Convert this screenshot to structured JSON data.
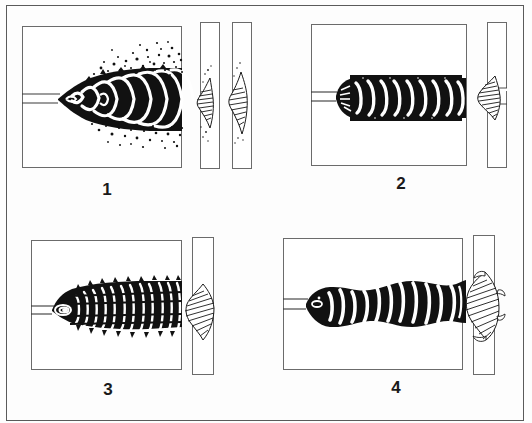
{
  "figure": {
    "background_color": "#ffffff",
    "ink_color": "#000000",
    "frame_color": "#5a5a5a",
    "border": true,
    "panel_count": 4
  },
  "panels": [
    {
      "id": "panel-1",
      "label": "1",
      "plan_view": {
        "description": "Wide flared weld bead with heavy spatter scattered above and below, coarse irregular ripples, bead widens toward right",
        "bead_style": "spatter-flared",
        "spatter": true,
        "ripple_count": 11
      },
      "section_views": [
        {
          "id": "section-1a",
          "description": "Hatched convex bead cross-section on left face of plate with spatter specks"
        },
        {
          "id": "section-1b",
          "description": "Hatched convex bead cross-section on right plate, taller and narrower"
        }
      ],
      "plate_count": 2
    },
    {
      "id": "panel-2",
      "label": "2",
      "plan_view": {
        "description": "Uniform straight parallel-sided weld bead with regular crescent ripples and even edges",
        "bead_style": "uniform-regular",
        "spatter": false,
        "ripple_count": 10
      },
      "section_views": [
        {
          "id": "section-2a",
          "description": "Hatched bead cross-section with flat low convexity on the plate joint"
        }
      ],
      "plate_count": 1
    },
    {
      "id": "panel-3",
      "label": "3",
      "plan_view": {
        "description": "Bead with fine closely spaced ripple segments, slightly tapered nose, rough serrated toes",
        "bead_style": "fine-ripple-serrated",
        "spatter": false,
        "ripple_count": 13
      },
      "section_views": [
        {
          "id": "section-3a",
          "description": "Hatched bead cross-section, rounded and symmetric on the plate"
        }
      ],
      "plate_count": 1
    },
    {
      "id": "panel-4",
      "label": "4",
      "plan_view": {
        "description": "Irregular wavy weld bead of varying width with uneven ripple spacing and undulating edges",
        "bead_style": "irregular-wavy",
        "spatter": false,
        "ripple_count": 11
      },
      "section_views": [
        {
          "id": "section-4a",
          "description": "Hatched bead cross-section, tall and bulging with overlapping toe"
        }
      ],
      "plate_count": 1
    }
  ]
}
